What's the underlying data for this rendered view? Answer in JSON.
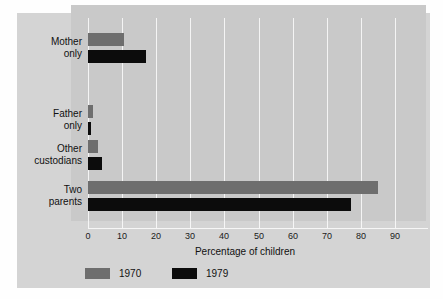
{
  "chart_data": {
    "type": "bar",
    "orientation": "horizontal",
    "title": "",
    "xlabel": "Percentage of children",
    "ylabel": "",
    "xlim": [
      0,
      90
    ],
    "xticks": [
      0,
      10,
      20,
      30,
      40,
      50,
      60,
      70,
      80,
      90
    ],
    "xticklabels": [
      "0",
      "10",
      "20",
      "30",
      "40",
      "50",
      "60",
      "70",
      "80",
      "90"
    ],
    "grid": "vertical",
    "legend_position": "below-axis",
    "categories": [
      "Mother only",
      "Father only",
      "Other custodians",
      "Two parents"
    ],
    "category_lines": [
      [
        "Mother",
        "only"
      ],
      [
        "Father",
        "only"
      ],
      [
        "Other",
        "custodians"
      ],
      [
        "Two",
        "parents"
      ]
    ],
    "series": [
      {
        "name": "1970",
        "color": "#6e6e6e",
        "values": [
          10.5,
          1.5,
          3.0,
          85.0
        ]
      },
      {
        "name": "1979",
        "color": "#0c0c0c",
        "values": [
          17.0,
          1.0,
          4.0,
          77.0
        ]
      }
    ]
  },
  "legend": {
    "items": [
      {
        "label": "1970",
        "color": "#6e6e6e"
      },
      {
        "label": "1979",
        "color": "#0c0c0c"
      }
    ]
  },
  "axis": {
    "x_title": "Percentage of children"
  },
  "colors": {
    "card_background": "#d4d4d4",
    "panel_background": "#c9c9c9",
    "gridline": "#f4f4f4",
    "series_1970": "#6e6e6e",
    "series_1979": "#0c0c0c",
    "text": "#111111"
  }
}
